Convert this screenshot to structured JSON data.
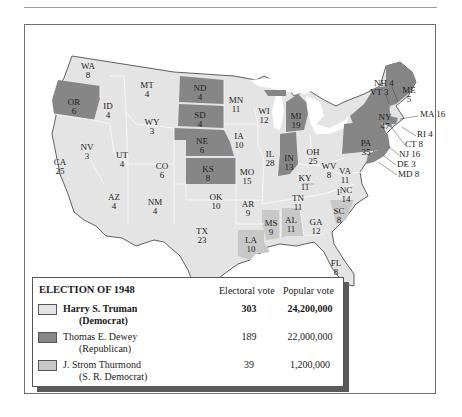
{
  "colors": {
    "democrat": "#e4e4e4",
    "republican": "#868686",
    "states_rights": "#c8c8c8",
    "state_border": "#f7f7f7",
    "water": "#ffffff",
    "legend_shadow": "#5a5a5a"
  },
  "map": {
    "states": [
      {
        "abbr": "WA",
        "ev": "8",
        "x": 64,
        "y": 42
      },
      {
        "abbr": "OR",
        "ev": "6",
        "x": 50,
        "y": 78,
        "party": "republican"
      },
      {
        "abbr": "CA",
        "ev": "25",
        "x": 36,
        "y": 138
      },
      {
        "abbr": "ID",
        "ev": "4",
        "x": 84,
        "y": 82
      },
      {
        "abbr": "NV",
        "ev": "3",
        "x": 63,
        "y": 123
      },
      {
        "abbr": "MT",
        "ev": "4",
        "x": 123,
        "y": 61
      },
      {
        "abbr": "WY",
        "ev": "3",
        "x": 128,
        "y": 98
      },
      {
        "abbr": "UT",
        "ev": "4",
        "x": 98,
        "y": 131
      },
      {
        "abbr": "CO",
        "ev": "6",
        "x": 138,
        "y": 142
      },
      {
        "abbr": "AZ",
        "ev": "4",
        "x": 90,
        "y": 173
      },
      {
        "abbr": "NM",
        "ev": "4",
        "x": 131,
        "y": 178
      },
      {
        "abbr": "ND",
        "ev": "4",
        "x": 176,
        "y": 64,
        "party": "republican"
      },
      {
        "abbr": "SD",
        "ev": "4",
        "x": 176,
        "y": 91,
        "party": "republican"
      },
      {
        "abbr": "NE",
        "ev": "6",
        "x": 178,
        "y": 117,
        "party": "republican"
      },
      {
        "abbr": "KS",
        "ev": "8",
        "x": 184,
        "y": 145,
        "party": "republican"
      },
      {
        "abbr": "OK",
        "ev": "10",
        "x": 192,
        "y": 173
      },
      {
        "abbr": "TX",
        "ev": "23",
        "x": 178,
        "y": 207
      },
      {
        "abbr": "MN",
        "ev": "11",
        "x": 212,
        "y": 76
      },
      {
        "abbr": "IA",
        "ev": "10",
        "x": 215,
        "y": 112
      },
      {
        "abbr": "MO",
        "ev": "15",
        "x": 223,
        "y": 148
      },
      {
        "abbr": "AR",
        "ev": "9",
        "x": 224,
        "y": 180
      },
      {
        "abbr": "LA",
        "ev": "10",
        "x": 227,
        "y": 216,
        "party": "states_rights"
      },
      {
        "abbr": "WI",
        "ev": "12",
        "x": 240,
        "y": 87
      },
      {
        "abbr": "IL",
        "ev": "28",
        "x": 246,
        "y": 130
      },
      {
        "abbr": "MI",
        "ev": "19",
        "x": 272,
        "y": 92,
        "party": "republican"
      },
      {
        "abbr": "IN",
        "ev": "13",
        "x": 265,
        "y": 134,
        "party": "republican"
      },
      {
        "abbr": "OH",
        "ev": "25",
        "x": 289,
        "y": 128
      },
      {
        "abbr": "KY",
        "ev": "11",
        "x": 281,
        "y": 154
      },
      {
        "abbr": "TN",
        "ev": "11",
        "x": 274,
        "y": 174
      },
      {
        "abbr": "MS",
        "ev": "9",
        "x": 247,
        "y": 199,
        "party": "states_rights"
      },
      {
        "abbr": "AL",
        "ev": "11",
        "x": 267,
        "y": 196,
        "party": "states_rights"
      },
      {
        "abbr": "GA",
        "ev": "12",
        "x": 292,
        "y": 198
      },
      {
        "abbr": "FL",
        "ev": "8",
        "x": 312,
        "y": 239
      },
      {
        "abbr": "SC",
        "ev": "8",
        "x": 315,
        "y": 187,
        "party": "states_rights"
      },
      {
        "abbr": "NC",
        "ev": "14",
        "x": 322,
        "y": 166
      },
      {
        "abbr": "VA",
        "ev": "11",
        "x": 321,
        "y": 147
      },
      {
        "abbr": "WV",
        "ev": "8",
        "x": 305,
        "y": 142
      },
      {
        "abbr": "PA",
        "ev": "35",
        "x": 342,
        "y": 119,
        "party": "republican"
      },
      {
        "abbr": "NY",
        "ev": "47",
        "x": 361,
        "y": 93,
        "party": "republican"
      },
      {
        "abbr": "ME",
        "ev": "5",
        "x": 385,
        "y": 66,
        "party": "republican"
      }
    ],
    "callouts": [
      {
        "text": "NH 4",
        "x": 350,
        "y": 59
      },
      {
        "text": "VT 3",
        "x": 346,
        "y": 68
      },
      {
        "text": "MA 16",
        "x": 396,
        "y": 90
      },
      {
        "text": "RI 4",
        "x": 393,
        "y": 110
      },
      {
        "text": "CT 8",
        "x": 381,
        "y": 120
      },
      {
        "text": "NJ 16",
        "x": 375,
        "y": 130
      },
      {
        "text": "DE 3",
        "x": 373,
        "y": 140
      },
      {
        "text": "MD 8",
        "x": 374,
        "y": 150
      },
      {
        "text": "1",
        "x": 312,
        "y": 168
      }
    ]
  },
  "legend": {
    "title": "ELECTION OF 1948",
    "col_electoral": "Electoral vote",
    "col_popular": "Popular vote",
    "rows": [
      {
        "name": "Harry S. Truman",
        "party": "(Democrat)",
        "electoral": "303",
        "popular": "24,200,000",
        "bold": true
      },
      {
        "name": "Thomas E. Dewey",
        "party": "(Republican)",
        "electoral": "189",
        "popular": "22,000,000"
      },
      {
        "name": "J. Strom Thurmond",
        "party": "(S. R. Democrat)",
        "electoral": "39",
        "popular": "1,200,000"
      }
    ]
  }
}
